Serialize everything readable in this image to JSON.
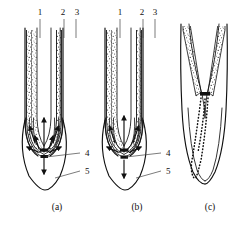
{
  "figure": {
    "width": 242,
    "height": 227,
    "background": "#ffffff",
    "ink_color": "#111111",
    "leader_color": "#444444"
  },
  "panels": [
    {
      "id": "a",
      "caption": "(a)",
      "caption_x": 57,
      "caption_y": 210,
      "description": "Intact root tip with stipple-filled cortex, converging acropetal and basipetal flow arrows through the root cap",
      "has_arrows": true,
      "has_dotted_trace": false,
      "tip_split": false
    },
    {
      "id": "b",
      "caption": "(b)",
      "caption_x": 137,
      "caption_y": 210,
      "description": "Root tip with added black block marker at the quiescent centre and downward efflux arrow",
      "has_arrows": true,
      "has_dotted_trace": false,
      "tip_split": false
    },
    {
      "id": "c",
      "caption": "(c)",
      "caption_x": 210,
      "caption_y": 210,
      "description": "Root tip with excised V-shaped cortex gap, block marker and dotted transport trace running to the apex",
      "has_arrows": false,
      "has_dotted_trace": true,
      "tip_split": true
    }
  ],
  "callouts": {
    "top": [
      {
        "number": "1",
        "x": 40,
        "y": 15,
        "line_x": 40,
        "line_y1": 19,
        "line_y2": 38,
        "panel": "a"
      },
      {
        "number": "2",
        "x": 63,
        "y": 15,
        "line_x": 64,
        "line_y1": 19,
        "line_y2": 38,
        "panel": "a"
      },
      {
        "number": "3",
        "x": 77,
        "y": 15,
        "line_x": 76,
        "line_y1": 19,
        "line_y2": 38,
        "panel": "a"
      },
      {
        "number": "1",
        "x": 120,
        "y": 15,
        "line_x": 120,
        "line_y1": 19,
        "line_y2": 38,
        "panel": "b"
      },
      {
        "number": "2",
        "x": 142,
        "y": 15,
        "line_x": 143,
        "line_y1": 19,
        "line_y2": 38,
        "panel": "b"
      },
      {
        "number": "3",
        "x": 155,
        "y": 15,
        "line_x": 155,
        "line_y1": 19,
        "line_y2": 38,
        "panel": "b"
      }
    ],
    "side": [
      {
        "number": "4",
        "x": 85,
        "y": 155,
        "panel": "a"
      },
      {
        "number": "5",
        "x": 85,
        "y": 173,
        "panel": "a"
      },
      {
        "number": "4",
        "x": 166,
        "y": 155,
        "panel": "b"
      },
      {
        "number": "5",
        "x": 166,
        "y": 173,
        "panel": "b"
      }
    ]
  },
  "legend_keys": {
    "1": "root cap / central column",
    "2": "cortex",
    "3": "epidermis",
    "4": "quiescent centre region",
    "5": "root cap outline"
  }
}
